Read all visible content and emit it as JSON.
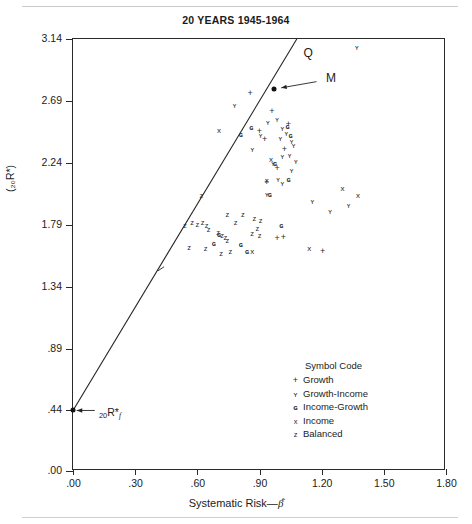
{
  "chart_data": {
    "type": "scatter",
    "title": "20 YEARS 1945-1964",
    "xlabel": "Systematic Risk—β̂",
    "ylabel": "Returns—Log Terminal Wealth Ratio—Net of Expenses",
    "ylabel_sub": "(₂₀R*)",
    "xlim": [
      0.0,
      1.8
    ],
    "ylim": [
      0.0,
      3.14
    ],
    "grid": false,
    "xticks": [
      ".00",
      ".30",
      ".60",
      ".90",
      "1.20",
      "1.50",
      "1.80"
    ],
    "xtick_values": [
      0.0,
      0.3,
      0.6,
      0.9,
      1.2,
      1.5,
      1.8
    ],
    "yticks": [
      ".00",
      ".44",
      ".89",
      "1.34",
      "1.79",
      "2.24",
      "2.69",
      "3.14"
    ],
    "ytick_values": [
      0.0,
      0.44,
      0.89,
      1.34,
      1.79,
      2.24,
      2.69,
      3.14
    ],
    "legend": {
      "title": "Symbol Code",
      "position": "inside-lower-right",
      "entries": [
        {
          "symbol": "+",
          "code": "growth",
          "label": "Growth"
        },
        {
          "symbol": "ʏ",
          "code": "growth-income",
          "label": "Growth-Income"
        },
        {
          "symbol": "ɢ",
          "code": "income-growth",
          "label": "Income-Growth"
        },
        {
          "symbol": "x",
          "code": "income",
          "label": "Income"
        },
        {
          "symbol": "z",
          "code": "balanced",
          "label": "Balanced"
        }
      ]
    },
    "market_line": {
      "label_intercept": "₂₀R*ғ",
      "label_top": "Q",
      "label_market": "M",
      "intercept_y": 0.44,
      "intercept_x": 0.0,
      "market_point": {
        "x": 0.97,
        "y": 2.78
      },
      "top_point": {
        "x": 1.08,
        "y": 3.14
      },
      "slope": 2.41
    },
    "annotations": [
      {
        "text": "Q",
        "x": 1.13,
        "y": 3.05
      },
      {
        "text": "M",
        "x": 1.24,
        "y": 2.85
      },
      {
        "text": "₂₀R*ғ",
        "x": 0.12,
        "y": 0.44
      }
    ],
    "series": [
      {
        "name": "Growth",
        "symbol": "+",
        "code": "growth",
        "points": [
          [
            0.855,
            2.75
          ],
          [
            0.96,
            2.62
          ],
          [
            1.04,
            2.52
          ],
          [
            1.02,
            2.34
          ],
          [
            0.985,
            2.2
          ],
          [
            0.935,
            2.1
          ],
          [
            1.205,
            1.6
          ],
          [
            0.985,
            1.69
          ],
          [
            1.015,
            1.7
          ],
          [
            0.925,
            2.41
          ],
          [
            0.9,
            2.47
          ]
        ]
      },
      {
        "name": "Growth-Income",
        "symbol": "ʏ",
        "code": "growth-income",
        "points": [
          [
            1.37,
            3.08
          ],
          [
            0.78,
            2.66
          ],
          [
            0.985,
            2.56
          ],
          [
            1.01,
            2.49
          ],
          [
            1.03,
            2.46
          ],
          [
            1.0,
            2.42
          ],
          [
            1.055,
            2.4
          ],
          [
            1.065,
            2.37
          ],
          [
            1.045,
            2.3
          ],
          [
            1.01,
            2.29
          ],
          [
            1.075,
            2.25
          ],
          [
            0.965,
            2.24
          ],
          [
            1.055,
            2.19
          ],
          [
            0.99,
            2.12
          ],
          [
            1.01,
            2.09
          ],
          [
            0.935,
            2.01
          ],
          [
            1.155,
            1.96
          ],
          [
            1.33,
            1.93
          ],
          [
            1.24,
            1.89
          ],
          [
            0.865,
            2.34
          ],
          [
            0.905,
            2.44
          ],
          [
            0.94,
            2.54
          ]
        ]
      },
      {
        "name": "Income-Growth",
        "symbol": "ɢ",
        "code": "income-growth",
        "points": [
          [
            0.81,
            2.45
          ],
          [
            0.86,
            2.5
          ],
          [
            1.035,
            2.51
          ],
          [
            1.05,
            2.44
          ],
          [
            0.975,
            2.24
          ],
          [
            1.04,
            2.12
          ],
          [
            0.95,
            2.01
          ],
          [
            1.005,
            1.79
          ],
          [
            0.84,
            1.6
          ],
          [
            0.81,
            1.65
          ],
          [
            0.68,
            1.66
          ],
          [
            0.705,
            1.72
          ]
        ]
      },
      {
        "name": "Income",
        "symbol": "x",
        "code": "income",
        "points": [
          [
            0.705,
            2.47
          ],
          [
            0.955,
            2.26
          ],
          [
            1.3,
            2.05
          ],
          [
            1.375,
            2.0
          ],
          [
            1.14,
            1.61
          ],
          [
            0.865,
            1.59
          ],
          [
            0.935,
            2.11
          ]
        ]
      },
      {
        "name": "Balanced",
        "symbol": "z",
        "code": "balanced",
        "points": [
          [
            0.62,
            2.0
          ],
          [
            0.745,
            1.86
          ],
          [
            0.82,
            1.86
          ],
          [
            0.875,
            1.83
          ],
          [
            0.905,
            1.82
          ],
          [
            0.785,
            1.8
          ],
          [
            0.54,
            1.78
          ],
          [
            0.575,
            1.8
          ],
          [
            0.6,
            1.79
          ],
          [
            0.625,
            1.8
          ],
          [
            0.645,
            1.78
          ],
          [
            0.655,
            1.75
          ],
          [
            0.7,
            1.73
          ],
          [
            0.72,
            1.71
          ],
          [
            0.735,
            1.69
          ],
          [
            0.745,
            1.67
          ],
          [
            0.56,
            1.62
          ],
          [
            0.64,
            1.61
          ],
          [
            0.715,
            1.58
          ],
          [
            0.76,
            1.59
          ],
          [
            0.9,
            1.71
          ],
          [
            0.89,
            1.76
          ],
          [
            0.865,
            1.72
          ]
        ]
      }
    ]
  }
}
